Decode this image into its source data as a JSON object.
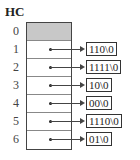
{
  "title": "HC",
  "rows": [
    {
      "index": "0",
      "value": null
    },
    {
      "index": "1",
      "value": "110\\0"
    },
    {
      "index": "2",
      "value": "1111\\0"
    },
    {
      "index": "3",
      "value": "10\\0"
    },
    {
      "index": "4",
      "value": "00\\0"
    },
    {
      "index": "5",
      "value": "1110\\0"
    },
    {
      "index": "6",
      "value": "01\\0"
    }
  ]
}
